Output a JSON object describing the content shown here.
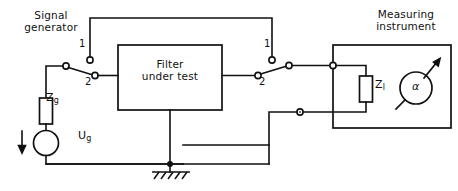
{
  "diagram": {
    "type": "circuit-schematic",
    "width": 458,
    "height": 191,
    "background_color": "#ffffff",
    "line_color": "#111111"
  },
  "blocks": {
    "signal_generator": {
      "title": "Signal\ngenerator",
      "components": {
        "source_impedance": {
          "label": "Z",
          "subscript": "g",
          "symbol": "resistor-rectangle"
        },
        "source_voltage": {
          "label": "U",
          "subscript": "g",
          "symbol": "circle-source"
        },
        "current_arrow": {
          "symbol": "down-arrow"
        }
      }
    },
    "filter_under_test": {
      "title": "Filter\nunder test",
      "line1": "Filter",
      "line2": "under test"
    },
    "measuring_instrument": {
      "title": "Measuring\ninstrument",
      "components": {
        "load_impedance": {
          "label": "Z",
          "subscript": "l",
          "symbol": "resistor-rectangle"
        },
        "indicator": {
          "label": "α",
          "symbol": "meter-circle-with-needle"
        }
      }
    }
  },
  "switches": {
    "left": {
      "name": "input-selector-switch",
      "terminals": [
        {
          "id": "1",
          "label": "1",
          "role": "bypass"
        },
        {
          "id": "2",
          "label": "2",
          "role": "through-filter"
        }
      ],
      "selected": "2"
    },
    "right": {
      "name": "output-selector-switch",
      "terminals": [
        {
          "id": "1",
          "label": "1",
          "role": "bypass"
        },
        {
          "id": "2",
          "label": "2",
          "role": "through-filter"
        }
      ],
      "selected": "2"
    }
  },
  "ground": {
    "name": "ground-symbol",
    "symbol": "earth-hatched"
  }
}
